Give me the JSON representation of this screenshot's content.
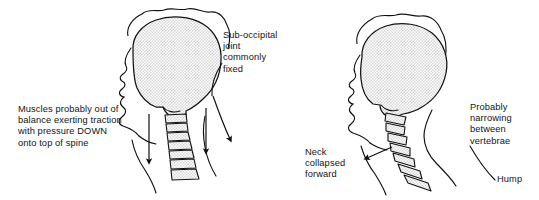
{
  "figure": {
    "background_color": "#ffffff",
    "ink_color": "#111111",
    "fill_color": "#e9e9e9"
  },
  "left_figure": {
    "name": "upright-head-posture",
    "labels": {
      "muscles": "Muscles probably out of balance exerting traction with pressure DOWN onto top of spine",
      "suboccipital": "Sub-occipital joint commonly fixed"
    },
    "arrows": [
      {
        "name": "traction-arrow-front",
        "direction": "down"
      },
      {
        "name": "traction-arrow-middle",
        "direction": "down"
      },
      {
        "name": "suboccipital-pointer",
        "direction": "down-right"
      }
    ],
    "vertebrae_count": 7
  },
  "right_figure": {
    "name": "forward-head-posture",
    "labels": {
      "neck": "Neck collapsed forward",
      "narrowing": "Probably narrowing between vertebrae",
      "hump": "Hump"
    },
    "arrows": [
      {
        "name": "neck-collapsed-pointer",
        "direction": "right"
      }
    ],
    "leaders": [
      {
        "name": "hump-leader"
      }
    ],
    "vertebrae_count": 7
  }
}
